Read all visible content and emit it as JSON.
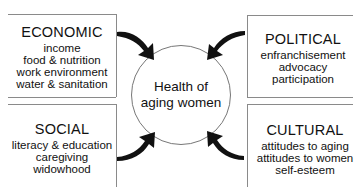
{
  "center": {
    "lines": [
      "Health of",
      "aging women"
    ]
  },
  "boxes": {
    "economic": {
      "title": "ECONOMIC",
      "items": [
        "income",
        "food & nutrition",
        "work environment",
        "water & sanitation"
      ]
    },
    "political": {
      "title": "POLITICAL",
      "items": [
        "enfranchisement",
        "advocacy",
        "participation"
      ]
    },
    "social": {
      "title": "SOCIAL",
      "items": [
        "literacy & education",
        "caregiving",
        "widowhood"
      ]
    },
    "cultural": {
      "title": "CULTURAL",
      "items": [
        "attitudes to aging",
        "attitudes to women",
        "self-esteem"
      ]
    }
  },
  "arrows": [
    {
      "from": "economic",
      "to": "center",
      "icon": "curved-arrow-icon"
    },
    {
      "from": "political",
      "to": "center",
      "icon": "curved-arrow-icon"
    },
    {
      "from": "social",
      "to": "center",
      "icon": "curved-arrow-icon"
    },
    {
      "from": "cultural",
      "to": "center",
      "icon": "curved-arrow-icon"
    }
  ],
  "colors": {
    "line": "#8a8a8a",
    "arrow": "#111111",
    "text": "#111111",
    "background": "#ffffff"
  }
}
